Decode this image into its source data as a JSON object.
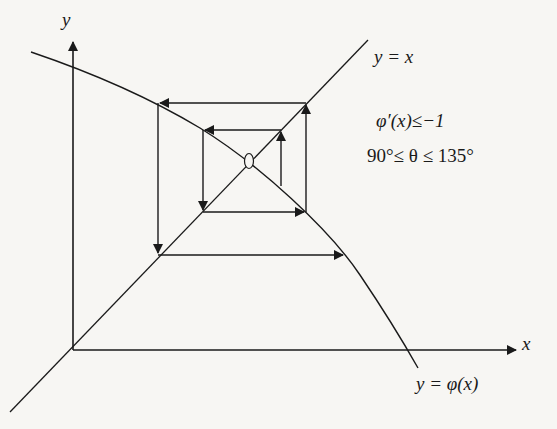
{
  "diagram": {
    "labels": {
      "y_axis": "y",
      "x_axis": "x",
      "identity_line": "y = x",
      "curve": "y = φ(x)",
      "derivative_condition": "φ′(x)≤−1",
      "angle_condition": "90°≤ θ ≤ 135°"
    },
    "colors": {
      "background": "#f7f6f3",
      "ink": "#1a1a1a"
    },
    "elements": {
      "axes": [
        "y-axis",
        "x-axis"
      ],
      "lines": [
        "y = x",
        "y = φ(x)"
      ],
      "fixed_point_marker": "ellipse at intersection of y = x and y = φ(x)",
      "cobweb_steps": [
        {
          "from": "inner vertical on right",
          "direction": "up"
        },
        {
          "from": "inner top horizontal",
          "direction": "left"
        },
        {
          "from": "inner left vertical",
          "direction": "down"
        },
        {
          "from": "inner bottom horizontal",
          "direction": "right"
        },
        {
          "from": "outer right vertical",
          "direction": "up"
        },
        {
          "from": "outer top horizontal",
          "direction": "left"
        },
        {
          "from": "outer left vertical",
          "direction": "down"
        },
        {
          "from": "outer bottom horizontal",
          "direction": "right"
        }
      ]
    }
  }
}
